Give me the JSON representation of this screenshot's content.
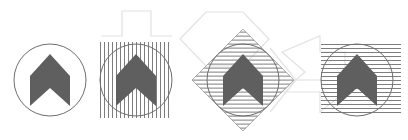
{
  "canvas": {
    "width": 408,
    "height": 140,
    "background": "#ffffff",
    "title": "Chevron logo hatch-pattern variations"
  },
  "palette": {
    "glyph_fill": "#5f5f5f",
    "circle_stroke": "#6e6e6e",
    "hatch_stroke": "#7d7d7d",
    "faint_outline": "#e2e2e2",
    "background": "#ffffff"
  },
  "glyph": {
    "name": "chevron-up-notched",
    "description": "Upward pointing chevron with notched base",
    "fill": "#5f5f5f"
  },
  "figures": [
    {
      "id": "figure-plain",
      "label": "Plain circle with chevron",
      "pattern": "none",
      "circle": {
        "cx": 50,
        "cy": 80,
        "r": 36
      },
      "glyph_scale": 1.0,
      "rotation": 0
    },
    {
      "id": "figure-vertical-hatch",
      "label": "Circle with vertical hatch",
      "pattern": "vertical-lines",
      "circle": {
        "cx": 136,
        "cy": 80,
        "r": 36
      },
      "hatch": {
        "spacing": 4,
        "stroke_width": 1,
        "angle": 90
      },
      "glyph_scale": 1.0,
      "rotation": 0
    },
    {
      "id": "figure-diagonal-hatch",
      "label": "Rotated square with diagonal hatch over circle",
      "pattern": "diagonal-lines",
      "circle": {
        "cx": 243,
        "cy": 80,
        "r": 36
      },
      "hatch": {
        "spacing": 4,
        "stroke_width": 1,
        "angle": 45
      },
      "glyph_scale": 1.0,
      "rotation": 45
    },
    {
      "id": "figure-horizontal-hatch",
      "label": "Circle with horizontal hatch",
      "pattern": "horizontal-lines",
      "circle": {
        "cx": 357,
        "cy": 80,
        "r": 36
      },
      "hatch": {
        "spacing": 4,
        "stroke_width": 1,
        "angle": 0
      },
      "glyph_scale": 1.0,
      "rotation": 0
    }
  ],
  "decorations": [
    {
      "id": "pulse-outline",
      "label": "Square pulse waveform outline",
      "stroke": "#e2e2e2"
    },
    {
      "id": "chevron-outline-left",
      "label": "Large faint chevron outline left",
      "stroke": "#e2e2e2"
    },
    {
      "id": "chevron-outline-right",
      "label": "Large faint chevron outline right",
      "stroke": "#e2e2e2"
    }
  ]
}
